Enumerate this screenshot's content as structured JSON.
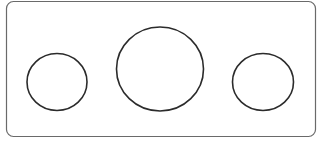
{
  "diagram": {
    "width": 326,
    "height": 141,
    "frame": {
      "x": 6.5,
      "y": 1.5,
      "width": 309,
      "height": 135,
      "rx": 7,
      "stroke": "#6a6a6a",
      "stroke_width": 1.2,
      "fill": "#ffffff"
    },
    "shapes": [
      {
        "name": "left-circle",
        "cx": 57,
        "cy": 82,
        "rx": 30,
        "ry": 28.5,
        "stroke": "#2b2b2b",
        "stroke_width": 1.6
      },
      {
        "name": "center-circle",
        "cx": 160,
        "cy": 69,
        "rx": 43.5,
        "ry": 42,
        "stroke": "#2b2b2b",
        "stroke_width": 1.6
      },
      {
        "name": "right-circle",
        "cx": 263,
        "cy": 82,
        "rx": 30.5,
        "ry": 28.5,
        "stroke": "#2b2b2b",
        "stroke_width": 1.6
      }
    ]
  }
}
